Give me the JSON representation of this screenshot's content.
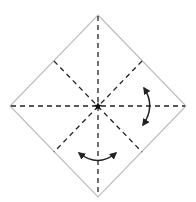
{
  "diagram": {
    "type": "origami-fold-diagram",
    "colors": {
      "paper_edge": "#bdbdbd",
      "crease": "#222222",
      "arrow": "#222222",
      "background": "#ffffff"
    },
    "paper": {
      "shape": "diamond",
      "vertices": {
        "top": [
          98,
          15
        ],
        "right": [
          186,
          106
        ],
        "bottom": [
          98,
          197
        ],
        "left": [
          10,
          106
        ]
      }
    },
    "center_mark": {
      "icon": "star-icon",
      "position": [
        98,
        106
      ]
    },
    "creases": [
      {
        "name": "vertical-crease",
        "from": [
          98,
          15
        ],
        "to": [
          98,
          197
        ],
        "style": "dashed"
      },
      {
        "name": "horizontal-crease",
        "from": [
          10,
          106
        ],
        "to": [
          186,
          106
        ],
        "style": "dashed"
      },
      {
        "name": "diagonal-crease-nw-se",
        "from": [
          54,
          61
        ],
        "to": [
          142,
          152
        ],
        "style": "dashed"
      },
      {
        "name": "diagonal-crease-ne-sw",
        "from": [
          142,
          61
        ],
        "to": [
          54,
          152
        ],
        "style": "dashed"
      }
    ],
    "arrows": [
      {
        "name": "right-rotation-arrow",
        "from": [
          145,
          87
        ],
        "to": [
          143,
          126
        ],
        "bulge": "right",
        "heads": "both"
      },
      {
        "name": "bottom-rotation-arrow",
        "from": [
          78,
          152
        ],
        "to": [
          117,
          152
        ],
        "bulge": "down",
        "heads": "both"
      }
    ]
  }
}
